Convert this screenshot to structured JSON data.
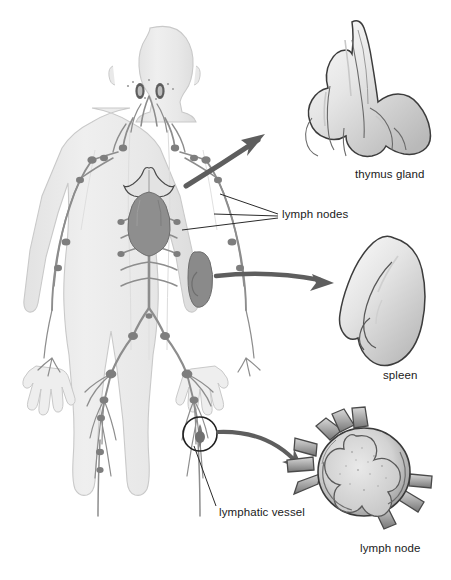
{
  "figure": {
    "background_color": "#ffffff",
    "body_fill": "#ededed",
    "body_stroke": "#c9c9c9",
    "vessel_color": "#8d8d8d",
    "node_color": "#7e7e7e",
    "organ_dark": "#8a8a8a",
    "arrow_color": "#5e5e5e",
    "leader_color": "#3a3a3a",
    "text_color": "#1a1a1a"
  },
  "labels": [
    {
      "id": "lymph-nodes",
      "text": "lymph nodes",
      "x": 282,
      "y": 215
    },
    {
      "id": "thymus-gland",
      "text": "thymus gland",
      "x": 355,
      "y": 175
    },
    {
      "id": "spleen",
      "text": "spleen",
      "x": 383,
      "y": 376
    },
    {
      "id": "lymphatic-vessel",
      "text": "lymphatic vessel",
      "x": 219,
      "y": 513
    },
    {
      "id": "lymph-node",
      "text": "lymph node",
      "x": 360,
      "y": 549
    }
  ],
  "insets": [
    {
      "id": "thymus-inset",
      "label": "thymus gland",
      "cx": 355,
      "cy": 95
    },
    {
      "id": "spleen-inset",
      "label": "spleen",
      "cx": 390,
      "cy": 300
    },
    {
      "id": "lymph-node-inset",
      "label": "lymph node",
      "cx": 370,
      "cy": 482
    }
  ],
  "callouts": [
    {
      "id": "thymus-arrow",
      "from": "chest thymus",
      "to": "thymus-inset"
    },
    {
      "id": "spleen-arrow",
      "from": "abdomen spleen",
      "to": "spleen-inset"
    },
    {
      "id": "lymph-node-arrow",
      "from": "groin vessel",
      "to": "lymph-node-inset"
    }
  ],
  "body_features": [
    {
      "name": "tonsils",
      "region": "head"
    },
    {
      "name": "cervical-nodes",
      "region": "neck"
    },
    {
      "name": "thymus",
      "region": "chest"
    },
    {
      "name": "heart",
      "region": "chest"
    },
    {
      "name": "spleen",
      "region": "abdomen"
    },
    {
      "name": "thoracic-duct",
      "region": "trunk"
    },
    {
      "name": "axillary-nodes",
      "region": "armpit"
    },
    {
      "name": "inguinal-nodes",
      "region": "groin"
    },
    {
      "name": "peripheral-vessels",
      "region": "limbs"
    }
  ],
  "highlight_circle": {
    "id": "vessel-highlight",
    "cx": 200,
    "cy": 434,
    "r": 17
  }
}
